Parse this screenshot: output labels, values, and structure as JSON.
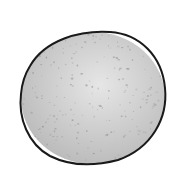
{
  "image": {
    "subject": "hand-drawn speckled gray sphere",
    "width": 190,
    "height": 179,
    "background": "#ffffff",
    "sphere": {
      "cx": 93,
      "cy": 98,
      "rx": 73,
      "ry": 67,
      "outline_color": "#1a1a1a",
      "fill_light": "#e4e4e4",
      "fill_mid": "#cfcfcf",
      "fill_dark": "#b8b8b8",
      "speckle_color": "#8a8a8a"
    }
  }
}
